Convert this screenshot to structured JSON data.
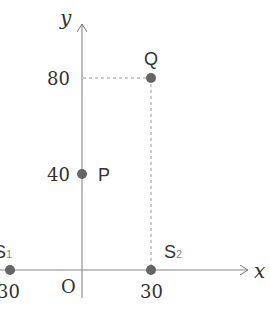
{
  "diagram": {
    "type": "coordinate-plane",
    "axes": {
      "x_label": "x",
      "y_label": "y",
      "origin_label": "O"
    },
    "ticks": {
      "y_80": "80",
      "y_40": "40",
      "x_30": "30",
      "x_neg30": "-30"
    },
    "points": [
      {
        "name": "Q",
        "x": 30,
        "y": 80
      },
      {
        "name": "P",
        "x": 0,
        "y": 40
      },
      {
        "name": "S1",
        "label_main": "S",
        "label_sub": "1",
        "x": -30,
        "y": 0
      },
      {
        "name": "S2",
        "label_main": "S",
        "label_sub": "2",
        "x": 30,
        "y": 0
      }
    ],
    "colors": {
      "axis": "#777777",
      "point": "#666666",
      "dashed": "#888888",
      "text": "#333333"
    }
  }
}
